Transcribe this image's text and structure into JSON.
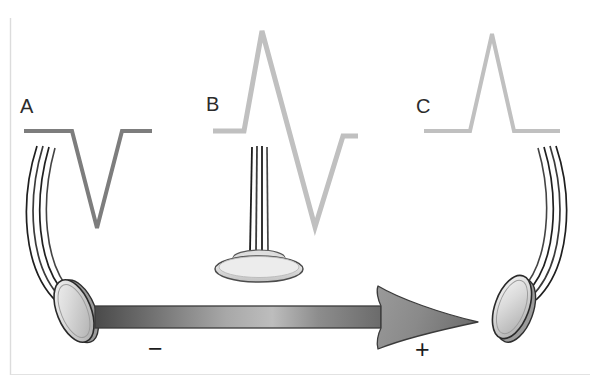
{
  "figure": {
    "canvas": {
      "width": 599,
      "height": 383,
      "background": "#ffffff"
    },
    "frame": {
      "color": "#dcdcdc",
      "visible": true
    }
  },
  "panels": [
    {
      "id": "A",
      "label": "A",
      "label_x": 20,
      "label_y": 113,
      "waveform": {
        "name": "negative-deflection",
        "description": "monophasic downward (negative) deflection",
        "color": "#7d7d7d",
        "stroke_width": 4,
        "baseline_y": 131,
        "points": "24,131 72,131 97,228 122,131 152,131"
      },
      "electrode": {
        "name": "electrode-left",
        "orientation": "tilted-away-left",
        "disc": {
          "cx": 74,
          "cy": 311,
          "rx": 17,
          "ry": 32,
          "rotate": -22
        },
        "cable": {
          "path": "M 36,146 C 20,200 24,268 56,300",
          "wires": 4
        }
      }
    },
    {
      "id": "B",
      "label": "B",
      "label_x": 206,
      "label_y": 111,
      "waveform": {
        "name": "biphasic-deflection",
        "description": "biphasic: upward peak followed by downward deflection",
        "color": "#c0c0c0",
        "stroke_width": 5,
        "baseline_y": 131,
        "points": "213,131 244,131 262,31 315,227 343,136 358,136"
      },
      "electrode": {
        "name": "electrode-center",
        "orientation": "face-on-perpendicular",
        "disc": {
          "cx": 259,
          "cy": 268,
          "rx": 44,
          "ry": 13,
          "rotate": 0
        },
        "cable": {
          "path": "M 259,146 L 259,250",
          "wires": 4
        }
      }
    },
    {
      "id": "C",
      "label": "C",
      "label_x": 416,
      "label_y": 111,
      "waveform": {
        "name": "positive-deflection",
        "description": "monophasic upward (positive) deflection",
        "color": "#c0c0c0",
        "stroke_width": 4,
        "baseline_y": 131,
        "points": "424,131 470,131 492,34 514,131 560,131"
      },
      "electrode": {
        "name": "electrode-right",
        "orientation": "tilted-away-right",
        "disc": {
          "cx": 512,
          "cy": 307,
          "rx": 17,
          "ry": 32,
          "rotate": 20
        },
        "cable": {
          "path": "M 556,146 C 572,198 566,266 534,298",
          "wires": 4
        }
      }
    }
  ],
  "arrow": {
    "name": "depolarization-direction-arrow",
    "description": "large right-pointing arrow indicating direction of depolarization wavefront",
    "shaft": {
      "x": 95,
      "y": 306,
      "width": 285,
      "height": 22
    },
    "tip_x": 478,
    "tip_y": 322,
    "gradient": {
      "start": "#4f4f4f",
      "mid": "#b4b4b4",
      "end": "#6e6e6e"
    },
    "outline": "#3a3a3a"
  },
  "polarity": {
    "negative": {
      "label": "−",
      "x": 148,
      "y": 357
    },
    "positive": {
      "label": "+",
      "x": 415,
      "y": 358
    }
  }
}
